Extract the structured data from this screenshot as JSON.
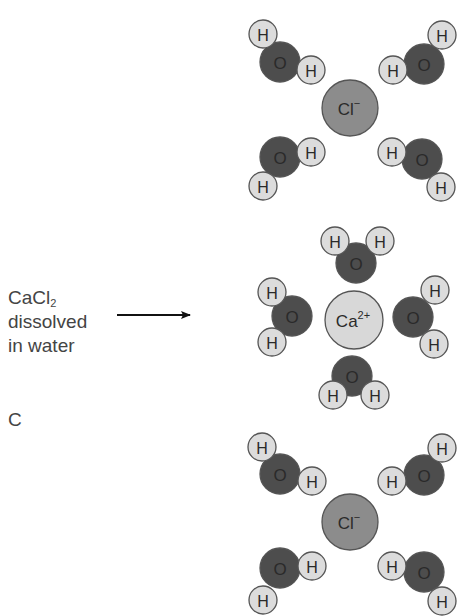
{
  "caption": {
    "line1_main": "CaCl",
    "line1_sub": "2",
    "line2": "dissolved",
    "line3": "in water",
    "panel_letter": "C"
  },
  "colors": {
    "hydrogen_fill": "#dcdcdc",
    "oxygen_fill": "#4d4d4d",
    "chloride_fill": "#8c8c8c",
    "calcium_fill": "#d8d8d8",
    "outline": "#555555",
    "arrow": "#111111",
    "text": "#444444"
  },
  "arrow": {
    "x1": 117,
    "x2": 190,
    "y": 315
  },
  "ions": [
    {
      "id": "cl-top",
      "label": "Cl",
      "charge": "−",
      "cx": 350,
      "cy": 108,
      "r": 28,
      "fill": "#8c8c8c"
    },
    {
      "id": "ca",
      "label": "Ca",
      "charge": "2+",
      "cx": 354,
      "cy": 320,
      "r": 29,
      "fill": "#d8d8d8"
    },
    {
      "id": "cl-bottom",
      "label": "Cl",
      "charge": "−",
      "cx": 350,
      "cy": 522,
      "r": 28,
      "fill": "#8c8c8c"
    }
  ],
  "water_molecules": [
    {
      "id": "top-cl-tl",
      "o": [
        280,
        62
      ],
      "h": [
        [
          263,
          34
        ],
        [
          311,
          70
        ]
      ]
    },
    {
      "id": "top-cl-tr",
      "o": [
        424,
        64
      ],
      "h": [
        [
          442,
          35
        ],
        [
          393,
          70
        ]
      ]
    },
    {
      "id": "top-cl-bl",
      "o": [
        280,
        157
      ],
      "h": [
        [
          311,
          152
        ],
        [
          263,
          186
        ]
      ]
    },
    {
      "id": "top-cl-br",
      "o": [
        422,
        159
      ],
      "h": [
        [
          392,
          152
        ],
        [
          441,
          187
        ]
      ]
    },
    {
      "id": "ca-top",
      "o": [
        356,
        263
      ],
      "h": [
        [
          335,
          241
        ],
        [
          380,
          241
        ]
      ]
    },
    {
      "id": "ca-left",
      "o": [
        292,
        316
      ],
      "h": [
        [
          272,
          292
        ],
        [
          272,
          342
        ]
      ]
    },
    {
      "id": "ca-right",
      "o": [
        413,
        317
      ],
      "h": [
        [
          435,
          290
        ],
        [
          434,
          344
        ]
      ]
    },
    {
      "id": "ca-bottom",
      "o": [
        352,
        376
      ],
      "h": [
        [
          333,
          395
        ],
        [
          375,
          395
        ]
      ]
    },
    {
      "id": "bot-cl-tl",
      "o": [
        280,
        474
      ],
      "h": [
        [
          262,
          447
        ],
        [
          312,
          481
        ]
      ]
    },
    {
      "id": "bot-cl-tr",
      "o": [
        424,
        475
      ],
      "h": [
        [
          442,
          448
        ],
        [
          392,
          481
        ]
      ]
    },
    {
      "id": "bot-cl-bl",
      "o": [
        280,
        568
      ],
      "h": [
        [
          312,
          566
        ],
        [
          263,
          600
        ]
      ]
    },
    {
      "id": "bot-cl-br",
      "o": [
        424,
        572
      ],
      "h": [
        [
          392,
          566
        ],
        [
          442,
          601
        ]
      ]
    }
  ],
  "atom_labels": {
    "oxygen": "O",
    "hydrogen": "H"
  },
  "radii": {
    "oxygen": 20,
    "hydrogen": 14
  }
}
